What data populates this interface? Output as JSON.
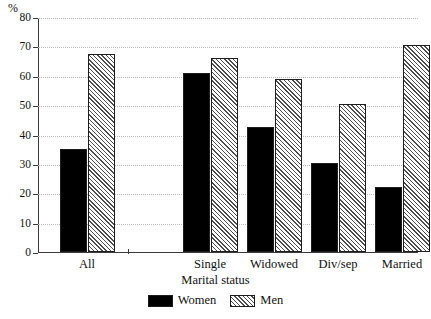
{
  "chart_data": {
    "type": "bar",
    "title": "",
    "xlabel": "Marital status",
    "ylabel": "%",
    "ylim": [
      0,
      80
    ],
    "yticks": [
      0,
      10,
      20,
      30,
      40,
      50,
      60,
      70,
      80
    ],
    "grid": true,
    "legend_position": "bottom-center",
    "categories": [
      "All",
      "Single",
      "Widowed",
      "Div/sep",
      "Married"
    ],
    "series": [
      {
        "name": "Women",
        "values": [
          35,
          61,
          42.5,
          30.3,
          22.3
        ],
        "color": "#000000",
        "fill": "solid"
      },
      {
        "name": "Men",
        "values": [
          67.3,
          66,
          59,
          50.5,
          70.5
        ],
        "color": "#f2f2f2",
        "fill": "diagonal-hatch"
      }
    ]
  },
  "axis": {
    "y_unit_label": "%",
    "y_tick_labels": [
      "0",
      "10",
      "20",
      "30",
      "40",
      "50",
      "60",
      "70",
      "80"
    ],
    "x_title": "Marital status",
    "x_tick_labels": [
      "All",
      "Single",
      "Widowed",
      "Div/sep",
      "Married"
    ]
  },
  "legend": {
    "items": [
      {
        "label": "Women",
        "swatch": "solid-black-swatch"
      },
      {
        "label": "Men",
        "swatch": "hatched-swatch"
      }
    ]
  }
}
